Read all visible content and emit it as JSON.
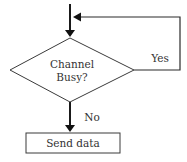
{
  "flowchart": {
    "decision": {
      "line1": "Channel",
      "line2": "Busy?"
    },
    "yes_label": "Yes",
    "no_label": "No",
    "process": {
      "label": "Send data"
    }
  }
}
